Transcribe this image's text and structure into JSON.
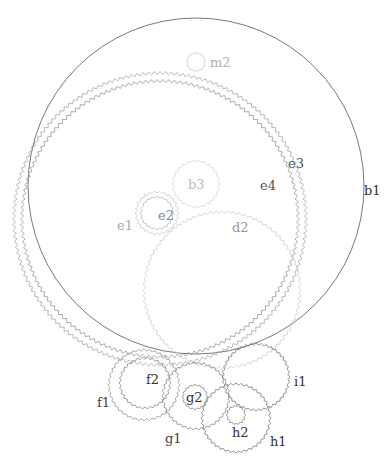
{
  "diagram": {
    "type": "gear-train",
    "width": 391,
    "height": 466,
    "background": "#ffffff"
  },
  "gears": [
    {
      "id": "b1",
      "label": "b1",
      "cx": 196,
      "cy": 186,
      "r": 168,
      "teeth": 0,
      "tooth_depth": 0,
      "stroke": "#555555",
      "stroke_width": 0.8,
      "label_x": 364,
      "label_y": 195,
      "label_color": "#333333"
    },
    {
      "id": "e3",
      "label": "e3",
      "cx": 160,
      "cy": 219,
      "r": 146,
      "teeth": 160,
      "tooth_depth": 3,
      "stroke": "#aaaaaa",
      "stroke_width": 0.8,
      "label_x": 288,
      "label_y": 168,
      "label_color": "#555555"
    },
    {
      "id": "e4",
      "label": "e4",
      "cx": 160,
      "cy": 219,
      "r": 138,
      "teeth": 150,
      "tooth_depth": 3,
      "stroke": "#999999",
      "stroke_width": 0.8,
      "label_x": 260,
      "label_y": 190,
      "label_color": "#555555"
    },
    {
      "id": "m2",
      "label": "m2",
      "cx": 196,
      "cy": 62,
      "r": 9,
      "teeth": 14,
      "tooth_depth": 1.5,
      "stroke": "#d0d0d0",
      "stroke_width": 0.8,
      "label_x": 210,
      "label_y": 67,
      "label_color": "#b0b0b0"
    },
    {
      "id": "b3",
      "label": "b3",
      "cx": 196,
      "cy": 184,
      "r": 23,
      "teeth": 26,
      "tooth_depth": 2,
      "stroke": "#d8d8d8",
      "stroke_width": 0.8,
      "label_x": 188,
      "label_y": 189,
      "label_color": "#bbbbbb"
    },
    {
      "id": "e1",
      "label": "e1",
      "cx": 157,
      "cy": 213,
      "r": 21,
      "teeth": 26,
      "tooth_depth": 2,
      "stroke": "#cccccc",
      "stroke_width": 0.8,
      "label_x": 117,
      "label_y": 230,
      "label_color": "#aaaaaa"
    },
    {
      "id": "e2",
      "label": "e2",
      "cx": 157,
      "cy": 213,
      "r": 16,
      "teeth": 20,
      "tooth_depth": 1.5,
      "stroke": "#bbbbbb",
      "stroke_width": 0.8,
      "label_x": 158,
      "label_y": 220,
      "label_color": "#888888"
    },
    {
      "id": "d2",
      "label": "d2",
      "cx": 222,
      "cy": 290,
      "r": 78,
      "teeth": 84,
      "tooth_depth": 2.5,
      "stroke": "#cfcfcf",
      "stroke_width": 0.8,
      "label_x": 232,
      "label_y": 232,
      "label_color": "#999999"
    },
    {
      "id": "f1",
      "label": "f1",
      "cx": 144,
      "cy": 385,
      "r": 35,
      "teeth": 40,
      "tooth_depth": 2,
      "stroke": "#999999",
      "stroke_width": 0.8,
      "label_x": 97,
      "label_y": 407,
      "label_color": "#444444"
    },
    {
      "id": "f2",
      "label": "f2",
      "cx": 145,
      "cy": 383,
      "r": 25,
      "teeth": 30,
      "tooth_depth": 2,
      "stroke": "#888888",
      "stroke_width": 0.8,
      "label_x": 146,
      "label_y": 384,
      "label_color": "#333333"
    },
    {
      "id": "g1",
      "label": "g1",
      "cx": 196,
      "cy": 396,
      "r": 33,
      "teeth": 38,
      "tooth_depth": 2,
      "stroke": "#888888",
      "stroke_width": 0.8,
      "label_x": 165,
      "label_y": 443,
      "label_color": "#444444"
    },
    {
      "id": "g2",
      "label": "g2",
      "cx": 195,
      "cy": 397,
      "r": 12,
      "teeth": 16,
      "tooth_depth": 1.5,
      "stroke": "#888888",
      "stroke_width": 0.8,
      "label_x": 186,
      "label_y": 402,
      "label_color": "#333333"
    },
    {
      "id": "i1",
      "label": "i1",
      "cx": 256,
      "cy": 377,
      "r": 33,
      "teeth": 40,
      "tooth_depth": 2,
      "stroke": "#777777",
      "stroke_width": 0.8,
      "label_x": 294,
      "label_y": 386,
      "label_color": "#333333"
    },
    {
      "id": "h1",
      "label": "h1",
      "cx": 236,
      "cy": 418,
      "r": 34,
      "teeth": 40,
      "tooth_depth": 2,
      "stroke": "#777777",
      "stroke_width": 0.8,
      "label_x": 270,
      "label_y": 446,
      "label_color": "#333333"
    },
    {
      "id": "h2",
      "label": "h2",
      "cx": 236,
      "cy": 415,
      "r": 9,
      "teeth": 14,
      "tooth_depth": 1.5,
      "stroke": "#888888",
      "stroke_width": 0.8,
      "label_x": 232,
      "label_y": 437,
      "label_color": "#333333"
    }
  ],
  "labels_order": [
    "m2",
    "e3",
    "e4",
    "b1",
    "b3",
    "e2",
    "e1",
    "d2",
    "f2",
    "f1",
    "g2",
    "g1",
    "i1",
    "h2",
    "h1"
  ]
}
